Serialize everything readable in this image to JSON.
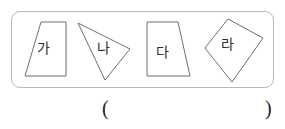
{
  "page": {
    "width": 285,
    "height": 129,
    "background_color": "#ffffff"
  },
  "shape_panel": {
    "border_color": "#b9b9b9",
    "border_radius": 9,
    "shapes": [
      {
        "label": "가",
        "icon": "trapezoid-shape",
        "shape_type": "trapezoid",
        "points": "41,22 66,22 66,76 25,76",
        "stroke_color": "#6f6f6f"
      },
      {
        "label": "나",
        "icon": "triangle-shape",
        "shape_type": "triangle",
        "points": "78,23 130,49 105,80",
        "stroke_color": "#6f6f6f"
      },
      {
        "label": "다",
        "icon": "trapezoid-shape",
        "shape_type": "trapezoid",
        "points": "147,22 178,22 190,76 147,76",
        "stroke_color": "#6f6f6f"
      },
      {
        "label": "라",
        "icon": "quadrilateral-shape",
        "shape_type": "quadrilateral",
        "points": "205,48 228,19 263,38 232,82",
        "stroke_color": "#6f6f6f"
      }
    ]
  },
  "answer": {
    "paren_open": "(",
    "paren_close": ")",
    "value": "",
    "placeholder": ""
  }
}
